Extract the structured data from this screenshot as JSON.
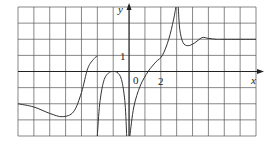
{
  "chart_data": {
    "type": "line",
    "title": "",
    "xlabel": "x",
    "ylabel": "y",
    "xlim": [
      -7,
      8
    ],
    "ylim": [
      -4,
      4
    ],
    "grid": true,
    "grid_step": 1,
    "tick_labels": {
      "origin": "0",
      "x": [
        {
          "value": 2,
          "label": "2"
        }
      ],
      "y": [
        {
          "value": 1,
          "label": "1"
        }
      ]
    },
    "series": [
      {
        "name": "f(x) piece 1",
        "points": [
          [
            -7,
            -2.0
          ],
          [
            -6,
            -2.2
          ],
          [
            -5,
            -2.6
          ],
          [
            -4.2,
            -2.8
          ],
          [
            -3.5,
            -2.5
          ],
          [
            -3,
            -1.3
          ],
          [
            -2.6,
            0.2
          ],
          [
            -2.2,
            0.8
          ],
          [
            -2,
            0.95
          ]
        ]
      },
      {
        "name": "f(x) piece 2",
        "points": [
          [
            -2,
            -4
          ],
          [
            -1.85,
            -2
          ],
          [
            -1.6,
            -0.6
          ],
          [
            -1.3,
            -0.1
          ],
          [
            -1,
            0
          ],
          [
            -0.7,
            -0.1
          ],
          [
            -0.45,
            -0.6
          ],
          [
            -0.25,
            -2
          ],
          [
            -0.15,
            -4
          ]
        ]
      },
      {
        "name": "f(x) piece 3",
        "points": [
          [
            0.05,
            -4
          ],
          [
            0.3,
            -2.2
          ],
          [
            0.7,
            -0.9
          ],
          [
            1.2,
            0
          ],
          [
            1.7,
            0.6
          ],
          [
            2.1,
            1.0
          ],
          [
            2.5,
            2.0
          ],
          [
            2.8,
            3.2
          ],
          [
            2.95,
            4
          ]
        ]
      },
      {
        "name": "f(x) piece 4",
        "points": [
          [
            3.1,
            4
          ],
          [
            3.2,
            2.6
          ],
          [
            3.4,
            1.8
          ],
          [
            3.7,
            1.6
          ],
          [
            4.1,
            1.75
          ],
          [
            4.6,
            2.1
          ],
          [
            5,
            2.05
          ],
          [
            5.5,
            2.0
          ],
          [
            6,
            2.0
          ],
          [
            8,
            2.0
          ]
        ]
      }
    ]
  },
  "labels": {
    "y_axis": "y",
    "x_axis": "x",
    "origin": "0",
    "one": "1",
    "two": "2"
  }
}
